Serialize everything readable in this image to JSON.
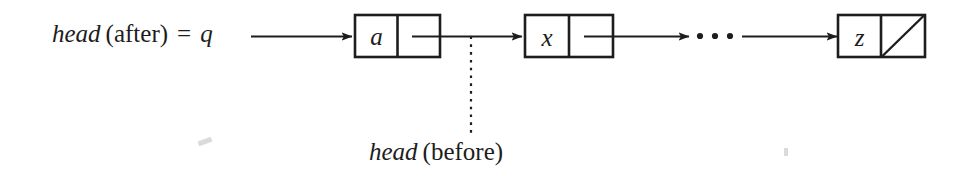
{
  "figure": {
    "background_color": "#ffffff",
    "ink_color": "#1d1d1d"
  },
  "labels": {
    "head_after": {
      "name_italic": "head",
      "qualifier": "(after)",
      "equals": "=",
      "variable_italic": "q",
      "full_text": "head (after) = q"
    },
    "head_before": {
      "name_italic": "head",
      "qualifier": "(before)",
      "full_text": "head (before)"
    }
  },
  "nodes": [
    {
      "id": "node-a",
      "value": "a",
      "pointer": "link",
      "null_pointer": false
    },
    {
      "id": "node-x",
      "value": "x",
      "pointer": "link",
      "null_pointer": false
    },
    {
      "id": "node-z",
      "value": "z",
      "pointer": "null",
      "null_pointer": true
    }
  ],
  "ellipsis": {
    "glyph": "···",
    "dot_count": 3
  },
  "connectors": [
    {
      "id": "arrow-head-to-a",
      "from": "head_after_label",
      "to": "node-a",
      "style": "solid-arrow"
    },
    {
      "id": "arrow-a-to-x",
      "from": "node-a-pointer",
      "to": "node-x",
      "style": "solid-arrow"
    },
    {
      "id": "arrow-x-to-ellipsis",
      "from": "node-x-pointer",
      "to": "ellipsis",
      "style": "solid-arrow"
    },
    {
      "id": "arrow-ellipsis-to-z",
      "from": "ellipsis",
      "to": "node-z",
      "style": "solid-arrow"
    },
    {
      "id": "dotted-head-before",
      "from": "head_before_label",
      "to": "node-a-pointer",
      "style": "dotted-line"
    }
  ]
}
